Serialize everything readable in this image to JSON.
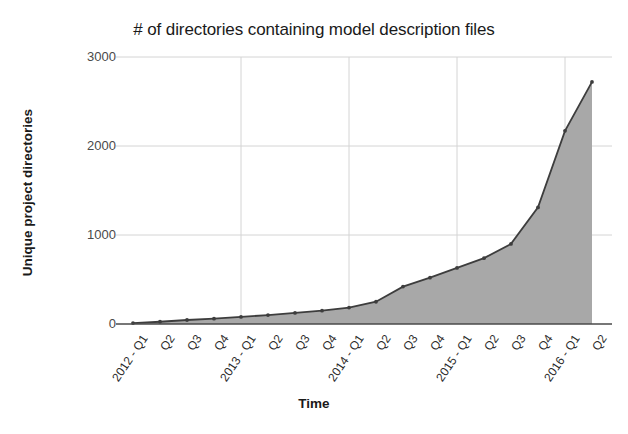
{
  "chart_data": {
    "type": "area",
    "title": "# of directories containing model description files",
    "xlabel": "Time",
    "ylabel": "Unique project directories",
    "categories": [
      "2012 - Q1",
      "Q2",
      "Q3",
      "Q4",
      "2013 - Q1",
      "Q2",
      "Q3",
      "Q4",
      "2014 - Q1",
      "Q2",
      "Q3",
      "Q4",
      "2015 - Q1",
      "Q2",
      "Q3",
      "Q4",
      "2016 - Q1",
      "Q2"
    ],
    "values": [
      10,
      25,
      45,
      60,
      80,
      100,
      125,
      150,
      185,
      250,
      420,
      520,
      630,
      740,
      900,
      1310,
      2170,
      2720
    ],
    "ylim": [
      0,
      3000
    ],
    "yticks": [
      0,
      1000,
      2000,
      3000
    ],
    "ytick_labels": [
      "0",
      "1000",
      "2000",
      "3000"
    ],
    "grid": true,
    "grid_axes": "both",
    "legend": "none",
    "series": [
      {
        "name": "Unique project directories",
        "values": [
          10,
          25,
          45,
          60,
          80,
          100,
          125,
          150,
          185,
          250,
          420,
          520,
          630,
          740,
          900,
          1310,
          2170,
          2720
        ],
        "line_color": "#3d3d3d",
        "fill_color": "#a8a8a8",
        "marker": "circle"
      }
    ],
    "colors": {
      "line": "#3d3d3d",
      "fill": "#a8a8a8",
      "grid": "#d4d4d4",
      "axis": "#4a4a4a",
      "text": "#1a1a1a",
      "background": "#ffffff"
    },
    "x_major_gridlines": [
      "2013 - Q1",
      "2014 - Q1",
      "2015 - Q1",
      "2016 - Q1"
    ]
  }
}
